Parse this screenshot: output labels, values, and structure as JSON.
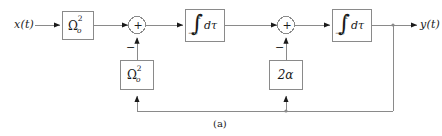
{
  "figure": {
    "caption": "(a)",
    "type": "control-system-block-diagram",
    "line_color": "#8a8a8a",
    "text_color": "#1a1a1a",
    "background": "#ffffff"
  },
  "signals": {
    "input_label": "x(t)",
    "output_label": "y(t)"
  },
  "blocks": {
    "forward_gain": {
      "symbol": "Ω",
      "superscript": "2",
      "subscript": "o",
      "text": "Ω²ₒ"
    },
    "integrator_1": {
      "integral_sign": "∫",
      "upper_limit": "t",
      "lower_limit": "−∞",
      "differential": "dτ",
      "text": "∫₋∞ᵗ dτ"
    },
    "integrator_2": {
      "integral_sign": "∫",
      "upper_limit": "t",
      "lower_limit": "−∞",
      "differential": "dτ",
      "text": "∫₋∞ᵗ dτ"
    },
    "feedback_gain_omega": {
      "symbol": "Ω",
      "superscript": "2",
      "subscript": "o",
      "text": "Ω²ₒ"
    },
    "feedback_gain_alpha": {
      "text": "2α"
    }
  },
  "summing_junctions": {
    "junction_1": {
      "operator": "+",
      "feedback_sign": "−"
    },
    "junction_2": {
      "operator": "+",
      "feedback_sign": "−"
    }
  }
}
